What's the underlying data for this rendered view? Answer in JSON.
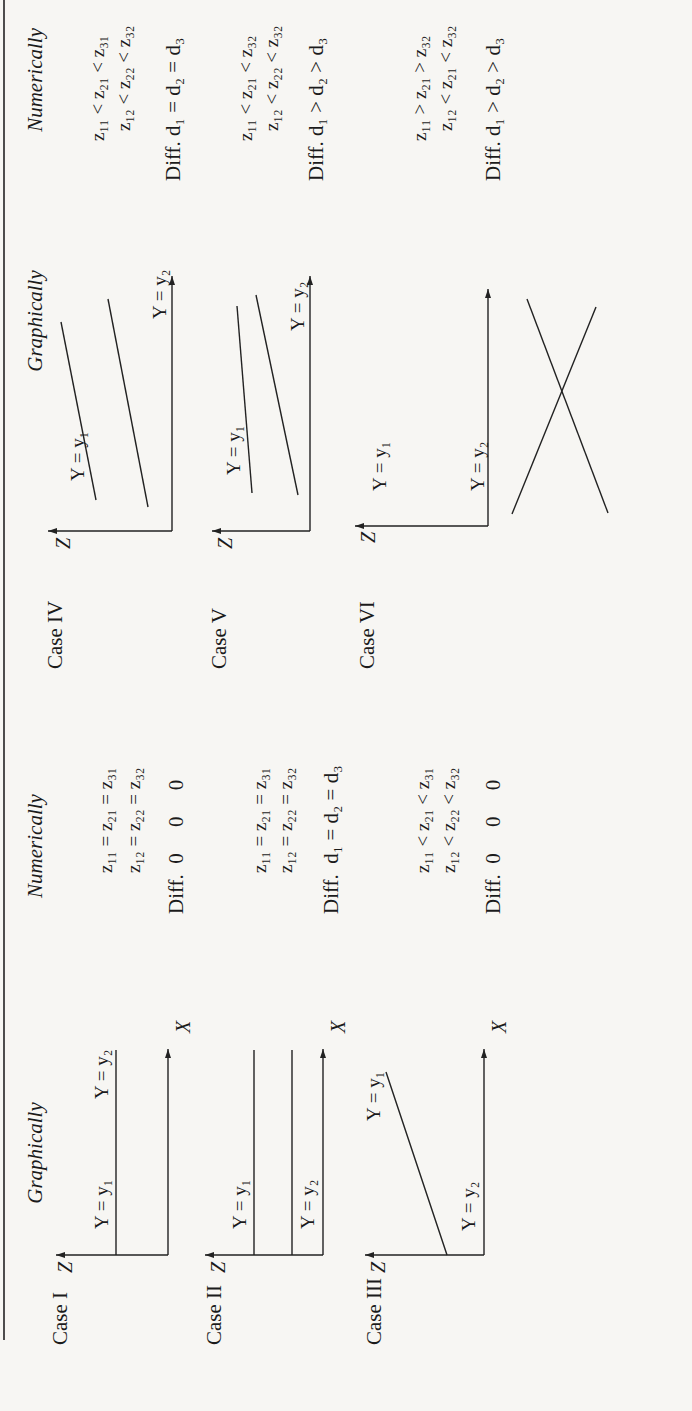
{
  "headers": {
    "graphically": "Graphically",
    "numerically": "Numerically"
  },
  "axis": {
    "z": "Z",
    "x": "X"
  },
  "cases": [
    {
      "label": "Case I",
      "lines": {
        "y1": "Y = y₁",
        "y2": "Y = y₂"
      },
      "numeric": [
        "z₁₁ = z₂₁ = z₃₁",
        "z₁₂ = z₂₂ = z₃₂"
      ],
      "diff": "Diff.  0     0     0"
    },
    {
      "label": "Case II",
      "lines": {
        "y1": "Y = y₁",
        "y2": "Y = y₂"
      },
      "numeric": [
        "z₁₁ = z₂₁ = z₃₁",
        "z₁₂ = z₂₂ = z₃₂"
      ],
      "diff": "Diff.  d₁ = d₂ = d₃"
    },
    {
      "label": "Case III",
      "lines": {
        "y1": "Y = y₁",
        "y2": "Y = y₂"
      },
      "numeric": [
        "z₁₁ < z₂₁ < z₃₁",
        "z₁₂ < z₂₂ < z₃₂"
      ],
      "diff": "Diff.  0     0     0"
    },
    {
      "label": "Case IV",
      "lines": {
        "y1": "Y = y₁",
        "y2": "Y = y₂"
      },
      "numeric": [
        "z₁₁ < z₂₁ < z₃₁",
        "z₁₂ < z₂₂ < z₃₂"
      ],
      "diff": "Diff.  d₁ = d₂ = d₃"
    },
    {
      "label": "Case V",
      "lines": {
        "y1": "Y = y₁",
        "y2": "Y = y₂"
      },
      "numeric": [
        "z₁₁ < z₂₁ < z₃₂",
        "z₁₂ < z₂₂ < z₃₂"
      ],
      "diff": "Diff.  d₁ > d₂ > d₃"
    },
    {
      "label": "Case VI",
      "lines": {
        "y1": "Y = y₁",
        "y2": "Y = y₂"
      },
      "numeric": [
        "z₁₁ > z₂₁ > z₃₂",
        "z₁₂ < z₂₁ < z₃₂"
      ],
      "diff": "Diff.  d₁ > d₂ > d₃"
    }
  ]
}
